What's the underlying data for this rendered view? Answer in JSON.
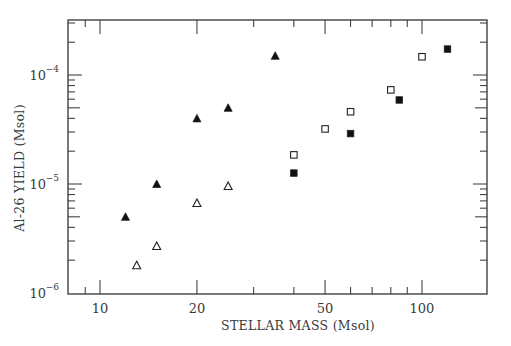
{
  "chart_data": {
    "type": "scatter",
    "title": "",
    "xlabel": "STELLAR MASS (Msol)",
    "ylabel": "Al-26 YIELD (Msol)",
    "xscale": "log",
    "yscale": "log",
    "xlim": [
      7.96,
      160
    ],
    "ylim": [
      1e-06,
      0.000316
    ],
    "grid": false,
    "legend": null,
    "x_ticks": [
      {
        "value": 10,
        "label": "10"
      },
      {
        "value": 20,
        "label": "20"
      },
      {
        "value": 50,
        "label": "50"
      },
      {
        "value": 100,
        "label": "100"
      }
    ],
    "y_ticks": [
      {
        "value": 1e-06,
        "base": "10",
        "exp": "-6"
      },
      {
        "value": 1e-05,
        "base": "10",
        "exp": "-5"
      },
      {
        "value": 0.0001,
        "base": "10",
        "exp": "-4"
      }
    ],
    "series": [
      {
        "name": "filled triangles",
        "marker": "triangle-filled",
        "color": "#000000",
        "points": [
          {
            "x": 12,
            "y": 5e-06
          },
          {
            "x": 15,
            "y": 1e-05
          },
          {
            "x": 20,
            "y": 4e-05
          },
          {
            "x": 25,
            "y": 5e-05
          },
          {
            "x": 35,
            "y": 0.00015
          }
        ]
      },
      {
        "name": "open triangles",
        "marker": "triangle-open",
        "color": "#000000",
        "points": [
          {
            "x": 13,
            "y": 1.8e-06
          },
          {
            "x": 15,
            "y": 2.7e-06
          },
          {
            "x": 20,
            "y": 6.7e-06
          },
          {
            "x": 25,
            "y": 9.6e-06
          }
        ]
      },
      {
        "name": "open squares",
        "marker": "square-open",
        "color": "#000000",
        "points": [
          {
            "x": 40,
            "y": 1.85e-05
          },
          {
            "x": 50,
            "y": 3.2e-05
          },
          {
            "x": 60,
            "y": 4.6e-05
          },
          {
            "x": 80,
            "y": 7.3e-05
          },
          {
            "x": 100,
            "y": 0.000147
          }
        ]
      },
      {
        "name": "filled squares",
        "marker": "square-filled",
        "color": "#000000",
        "points": [
          {
            "x": 40,
            "y": 1.26e-05
          },
          {
            "x": 60,
            "y": 2.9e-05
          },
          {
            "x": 85,
            "y": 5.9e-05
          },
          {
            "x": 120,
            "y": 0.000173
          }
        ]
      }
    ]
  },
  "layout": {
    "plot": {
      "left": 68,
      "top": 20,
      "right": 487,
      "bottom": 294
    },
    "x_decade_px": 322,
    "x_ref": {
      "value": 10,
      "px": 100
    },
    "y_decade_px": 109,
    "y_ref": {
      "value": 1e-06,
      "px": 293
    }
  }
}
